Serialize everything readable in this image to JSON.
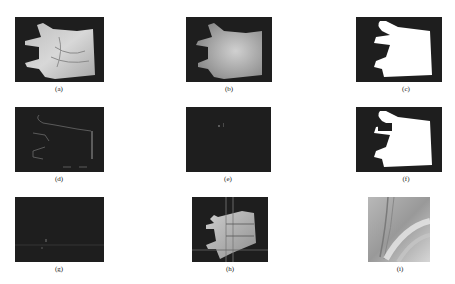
{
  "figure": {
    "panels": [
      {
        "id": "a",
        "label": "(a)",
        "content": "grayscale hand/palm image"
      },
      {
        "id": "b",
        "label": "(b)",
        "content": "smoothed grayscale hand image"
      },
      {
        "id": "c",
        "label": "(c)",
        "content": "binary hand silhouette"
      },
      {
        "id": "d",
        "label": "(d)",
        "content": "hand contour edges"
      },
      {
        "id": "e",
        "label": "(e)",
        "content": "dark image with small feature point"
      },
      {
        "id": "f",
        "label": "(f)",
        "content": "binary silhouette with notch"
      },
      {
        "id": "g",
        "label": "(g)",
        "content": "dark image with key point and horizontal line"
      },
      {
        "id": "h",
        "label": "(h)",
        "content": "hand image with ROI grid lines"
      },
      {
        "id": "i",
        "label": "(i)",
        "content": "extracted palm region of interest"
      }
    ]
  }
}
